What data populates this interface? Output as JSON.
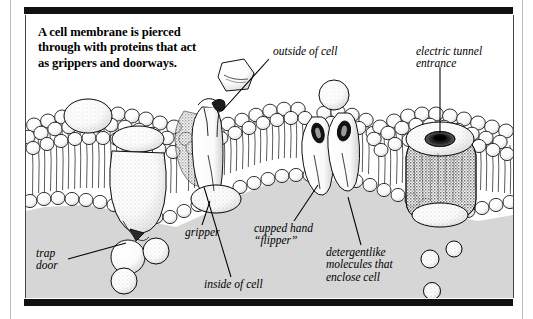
{
  "figure": {
    "title": "A cell membrane is pierced through with proteins that act as grippers and doorways.",
    "title_lines": [
      "A cell membrane is pierced",
      "through with proteins that act",
      "as grippers and doorways."
    ],
    "labels": [
      {
        "id": "outside-of-cell",
        "lines": [
          "outside of cell"
        ]
      },
      {
        "id": "electric-tunnel",
        "lines": [
          "electric tunnel",
          "entrance"
        ]
      },
      {
        "id": "trap-door",
        "lines": [
          "trap",
          "door"
        ]
      },
      {
        "id": "gripper",
        "lines": [
          "gripper"
        ]
      },
      {
        "id": "cupped-hand",
        "lines": [
          "cupped hand",
          "“flipper”"
        ]
      },
      {
        "id": "inside-of-cell",
        "lines": [
          "inside of cell"
        ]
      },
      {
        "id": "detergentlike",
        "lines": [
          "detergentlike",
          "molecules that",
          "enclose cell"
        ]
      }
    ],
    "colors": {
      "ink": "#000000",
      "paper": "#ffffff",
      "cytoplasm_gray": "#d6d6d6",
      "bar_black": "#111111",
      "gutter_rule": "#b9b9b9"
    },
    "artwork": {
      "style": "pen-and-ink stipple line drawing",
      "subject": "phospholipid bilayer cell membrane cross-section",
      "elements": [
        "lipid bilayer with spherical head groups and hair-like tails",
        "embedded globular membrane proteins",
        "gripper protein spanning the bilayer",
        "cupped hand flipper protein pair",
        "electric tunnel entrance pore",
        "trap door invagination",
        "free-floating detergentlike molecules",
        "polygonal particle outside the cell"
      ]
    }
  }
}
